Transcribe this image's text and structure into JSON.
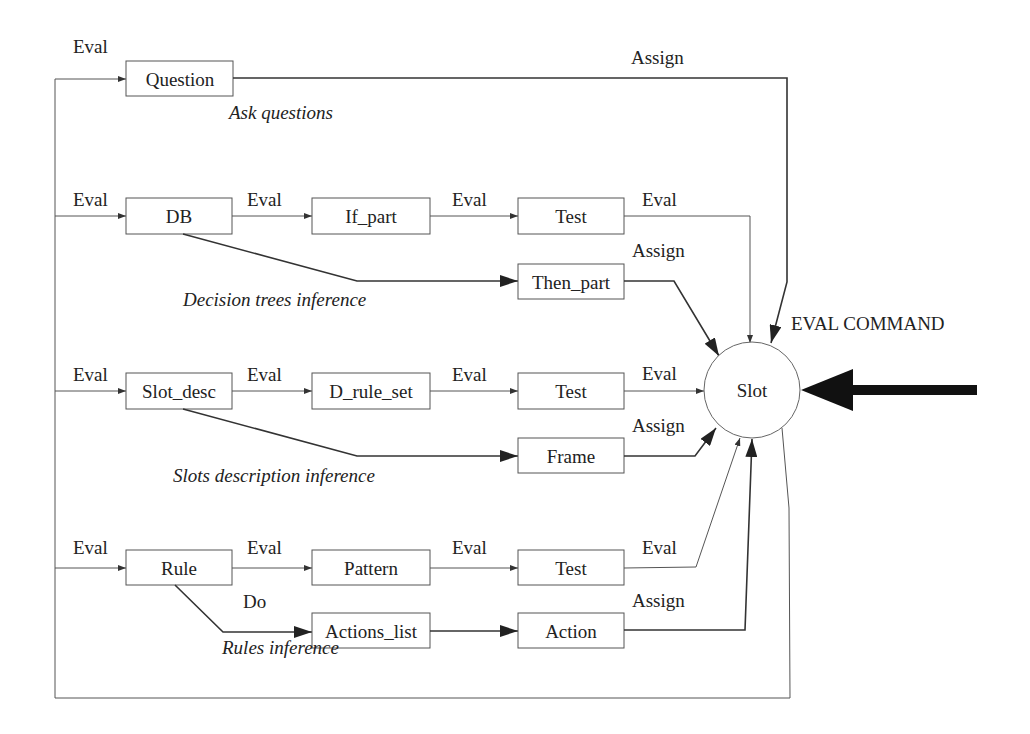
{
  "diagram": {
    "nodes": {
      "question": "Question",
      "db": "DB",
      "if_part": "If_part",
      "test_dt": "Test",
      "then_part": "Then_part",
      "slot_desc": "Slot_desc",
      "d_rule_set": "D_rule_set",
      "test_sd": "Test",
      "frame": "Frame",
      "rule": "Rule",
      "pattern": "Pattern",
      "test_r": "Test",
      "actions_list": "Actions_list",
      "action": "Action",
      "slot": "Slot"
    },
    "edge_labels": {
      "eval": "Eval",
      "assign": "Assign",
      "do": "Do"
    },
    "captions": {
      "ask_questions": "Ask questions",
      "decision_trees": "Decision trees inference",
      "slots_description": "Slots description inference",
      "rules": "Rules inference"
    },
    "command_label": "EVAL COMMAND"
  }
}
